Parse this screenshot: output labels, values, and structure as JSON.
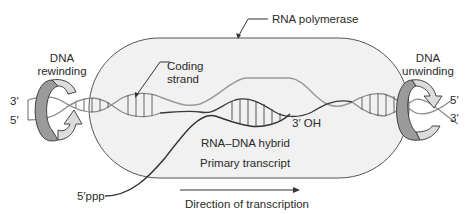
{
  "diagram": {
    "labels": {
      "rna_polymerase": "RNA polymerase",
      "coding_strand_line1": "Coding",
      "coding_strand_line2": "strand",
      "dna_rewinding_line1": "DNA",
      "dna_rewinding_line2": "rewinding",
      "dna_unwinding_line1": "DNA",
      "dna_unwinding_line2": "unwinding",
      "left_top_end": "3′",
      "left_bottom_end": "5′",
      "right_top_end": "5′",
      "right_bottom_end": "3′",
      "rna_3_oh": "3′ OH",
      "rna_dna_hybrid": "RNA–DNA hybrid",
      "primary_transcript": "Primary transcript",
      "rna_5_ppp": "5′ppp",
      "direction": "Direction of transcription"
    },
    "colors": {
      "polymerase_fill": "#f1f1f1",
      "polymerase_stroke": "#555555",
      "dna_strand": "#8a8a8a",
      "coding_strand": "#9a9a9a",
      "template_strand": "#3a3a3a",
      "rna_strand": "#333333",
      "arrow_dark": "#9b9b9b",
      "arrow_light": "#dcdcdc",
      "text": "#2a2a2a"
    }
  }
}
